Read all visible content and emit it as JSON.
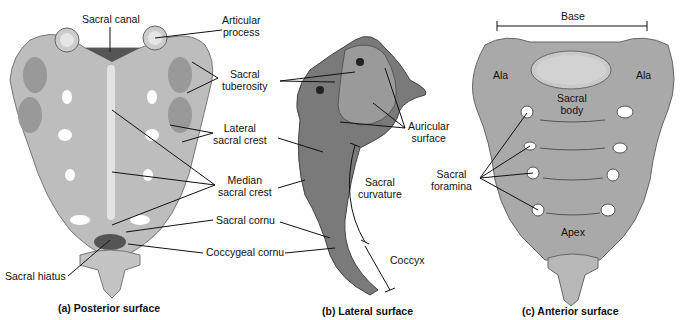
{
  "panels": [
    {
      "id": "posterior",
      "caption": "(a) Posterior surface",
      "labels": {
        "sacral_canal": "Sacral canal",
        "articular_process_1": "Articular",
        "articular_process_2": "process",
        "sacral_tuberosity_1": "Sacral",
        "sacral_tuberosity_2": "tuberosity",
        "lateral_sacral_crest_1": "Lateral",
        "lateral_sacral_crest_2": "sacral crest",
        "median_sacral_crest_1": "Median",
        "median_sacral_crest_2": "sacral crest",
        "sacral_cornu": "Sacral cornu",
        "coccygeal_cornu": "Coccygeal cornu",
        "sacral_hiatus": "Sacral hiatus"
      }
    },
    {
      "id": "lateral",
      "caption": "(b) Lateral surface",
      "labels": {
        "auricular_surface_1": "Auricular",
        "auricular_surface_2": "surface",
        "sacral_curvature_1": "Sacral",
        "sacral_curvature_2": "curvature",
        "coccyx": "Coccyx"
      }
    },
    {
      "id": "anterior",
      "caption": "(c) Anterior surface",
      "labels": {
        "base": "Base",
        "ala_left": "Ala",
        "ala_right": "Ala",
        "sacral_body_1": "Sacral",
        "sacral_body_2": "body",
        "sacral_foramina_1": "Sacral",
        "sacral_foramina_2": "foramina",
        "apex": "Apex"
      }
    }
  ],
  "colors": {
    "bone": "#b9b9b9",
    "bone_dark": "#8a8a8a",
    "bone_light": "#d6d6d6",
    "leader_line": "#111111"
  }
}
